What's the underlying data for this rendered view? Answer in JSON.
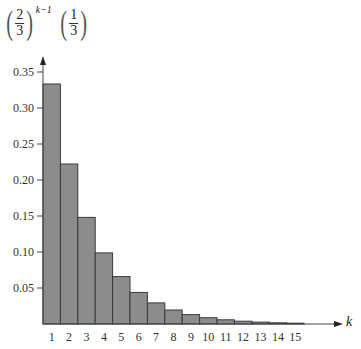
{
  "chart_data": {
    "type": "bar",
    "title": "",
    "ylabel": "(2/3)^(k-1) (1/3)",
    "ylabel_parts": {
      "base_num": "2",
      "base_den": "3",
      "exponent": "k−1",
      "factor_num": "1",
      "factor_den": "3"
    },
    "xlabel": "k",
    "categories": [
      "1",
      "2",
      "3",
      "4",
      "5",
      "6",
      "7",
      "8",
      "9",
      "10",
      "11",
      "12",
      "13",
      "14",
      "15"
    ],
    "values": [
      0.3333,
      0.2222,
      0.1481,
      0.0988,
      0.0658,
      0.0439,
      0.0293,
      0.0195,
      0.013,
      0.0087,
      0.0058,
      0.0039,
      0.0026,
      0.0017,
      0.0011
    ],
    "yticks": [
      0.05,
      0.1,
      0.15,
      0.2,
      0.25,
      0.3,
      0.35
    ],
    "ytick_labels": [
      "0.05",
      "0.10",
      "0.15",
      "0.20",
      "0.25",
      "0.30",
      "0.35"
    ],
    "ylim": [
      0,
      0.37
    ],
    "grid": false,
    "legend": null,
    "bar_color": "#8c8c8c"
  }
}
